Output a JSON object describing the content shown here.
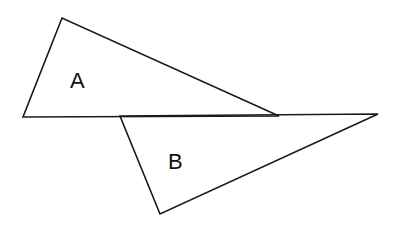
{
  "diagram": {
    "stroke_color": "#1a1a1a",
    "background": "#ffffff",
    "shapes": [
      {
        "id": "triangle-a",
        "type": "triangle",
        "label": "A",
        "points": "62,18 23,117 279,116",
        "label_position": {
          "x": 70,
          "y": 88
        }
      },
      {
        "id": "triangle-b",
        "type": "triangle",
        "label": "B",
        "points": "120,116 378,114 160,214",
        "label_position": {
          "x": 168,
          "y": 169
        }
      }
    ]
  }
}
